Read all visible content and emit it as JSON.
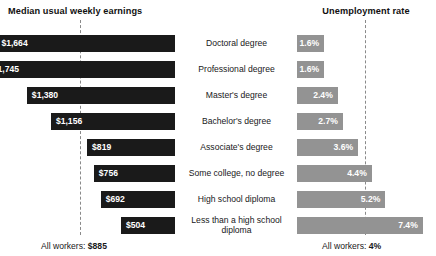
{
  "left_panel": {
    "title": "Median usual weekly earnings",
    "footer_prefix": "All workers: ",
    "footer_value": "$885"
  },
  "right_panel": {
    "title": "Unemployment rate",
    "footer_prefix": "All workers: ",
    "footer_value": "4%"
  },
  "chart_data": {
    "type": "bar",
    "orientation": "horizontal-diverging",
    "categories": [
      "Doctoral degree",
      "Professional degree",
      "Master's degree",
      "Bachelor's degree",
      "Associate's degree",
      "Some college, no degree",
      "High school diploma",
      "Less than a high school diploma"
    ],
    "series": [
      {
        "name": "Median usual weekly earnings",
        "side": "left",
        "unit": "USD per week",
        "color": "#1a1a1a",
        "values": [
          1664,
          1745,
          1380,
          1156,
          819,
          756,
          692,
          504
        ],
        "labels": [
          "$1,664",
          "$1,745",
          "$1,380",
          "$1,156",
          "$819",
          "$756",
          "$692",
          "$504"
        ],
        "reference_line": {
          "label": "All workers",
          "value": 885,
          "display": "$885"
        },
        "axis_max": 1745
      },
      {
        "name": "Unemployment rate",
        "side": "right",
        "unit": "percent",
        "color": "#939393",
        "values": [
          1.6,
          1.6,
          2.4,
          2.7,
          3.6,
          4.4,
          5.2,
          7.4
        ],
        "labels": [
          "1.6%",
          "1.6%",
          "2.4%",
          "2.7%",
          "3.6%",
          "4.4%",
          "5.2%",
          "7.4%"
        ],
        "reference_line": {
          "label": "All workers",
          "value": 4,
          "display": "4%"
        },
        "axis_max": 7.4
      }
    ],
    "xlabel": "",
    "ylabel": "",
    "grid": false,
    "legend": "none",
    "background_color": "#ffffff"
  }
}
